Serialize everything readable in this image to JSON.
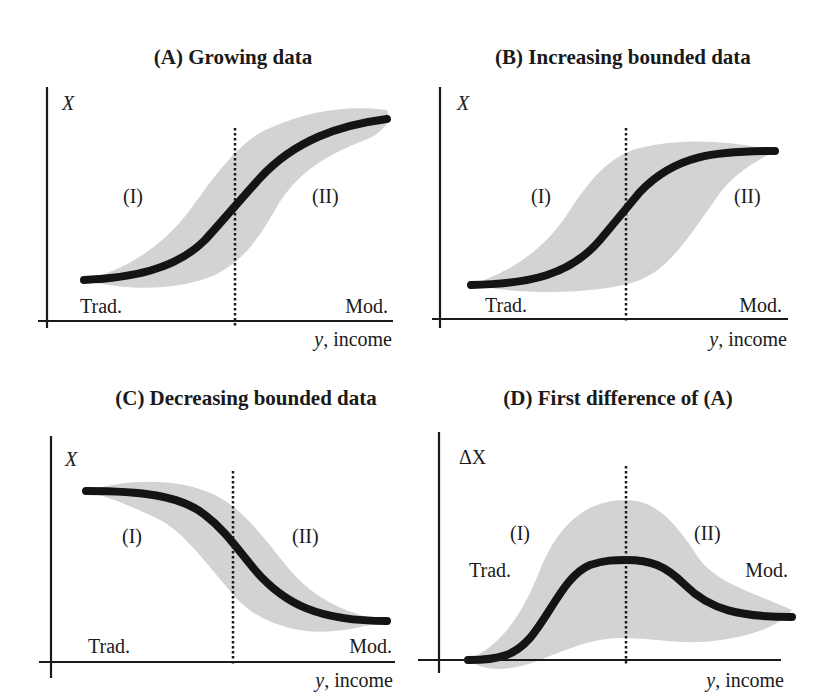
{
  "panels": [
    {
      "id": "A",
      "title": "(A) Growing data",
      "y_label": "X",
      "x_label_var": "y",
      "x_label_rest": ", income",
      "region_left": "(I)",
      "region_right": "(II)",
      "left_end_label": "Trad.",
      "right_end_label": "Mod."
    },
    {
      "id": "B",
      "title": "(B) Increasing bounded data",
      "y_label": "X",
      "x_label_var": "y",
      "x_label_rest": ", income",
      "region_left": "(I)",
      "region_right": "(II)",
      "left_end_label": "Trad.",
      "right_end_label": "Mod."
    },
    {
      "id": "C",
      "title": "(C) Decreasing bounded data",
      "y_label": "X",
      "x_label_var": "y",
      "x_label_rest": ", income",
      "region_left": "(I)",
      "region_right": "(II)",
      "left_end_label": "Trad.",
      "right_end_label": "Mod."
    },
    {
      "id": "D",
      "title": "(D) First difference of (A)",
      "y_label": "ΔX",
      "x_label_var": "y",
      "x_label_rest": ", income",
      "region_left": "(I)",
      "region_right": "(II)",
      "left_end_label": "Trad.",
      "right_end_label": "Mod."
    }
  ],
  "colors": {
    "curve": "#141414",
    "band": "#d3d3d3",
    "axis": "#1a1a1a",
    "background": "#ffffff"
  }
}
